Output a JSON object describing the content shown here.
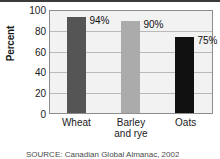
{
  "chart_data": {
    "type": "bar",
    "title": "",
    "subtitle": "",
    "xlabel": "",
    "ylabel": "Percent",
    "ylim": [
      0,
      100
    ],
    "yticks": [
      100,
      80,
      60,
      40,
      20,
      0
    ],
    "grid": true,
    "legend": false,
    "categories": [
      "Wheat",
      "Barley and rye",
      "Oats"
    ],
    "values": [
      94,
      90,
      75
    ],
    "data_labels": [
      "94%",
      "90%",
      "75%"
    ],
    "bar_colors": [
      "#555555",
      "#ababab",
      "#111111"
    ],
    "category_lines": [
      [
        "Wheat",
        ""
      ],
      [
        "Barley",
        "and rye"
      ],
      [
        "Oats",
        ""
      ]
    ]
  },
  "axes": {
    "y_title": "Percent",
    "y_tick_labels": [
      "100",
      "80",
      "60",
      "40",
      "20",
      "0"
    ]
  },
  "footer": {
    "source": "SOURCE: Canadian Global Almanac, 2002"
  },
  "colors": {
    "plot_background": "#f2f2f2",
    "plot_border": "#8d8d8d",
    "gridline": "#b9b9b9",
    "text": "#1a1a1a",
    "top_rule": "#3a3a3a"
  }
}
